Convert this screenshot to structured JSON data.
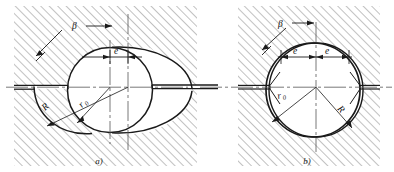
{
  "figure": {
    "type": "engineering-section-drawing",
    "subfigures": [
      {
        "caption": "a)",
        "labels": {
          "beta": "β",
          "eccentricity": "e",
          "outer_radius": "R",
          "inner_radius": "r",
          "inner_radius_sub": "0"
        }
      },
      {
        "caption": "b)",
        "labels": {
          "beta": "β",
          "eccentricity_left": "e",
          "eccentricity_right": "e",
          "outer_radius": "R",
          "inner_radius": "r",
          "inner_radius_sub": "0"
        }
      }
    ]
  },
  "style": {
    "hatch_color": "#8d8d8d",
    "line_color": "#1a1a1a",
    "center_line_color": "#555555",
    "background": "#ffffff"
  }
}
